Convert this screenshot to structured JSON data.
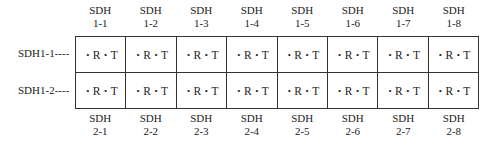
{
  "top_labels": [
    {
      "line1": "SDH",
      "line2": "1-1"
    },
    {
      "line1": "SDH",
      "line2": "1-2"
    },
    {
      "line1": "SDH",
      "line2": "1-3"
    },
    {
      "line1": "SDH",
      "line2": "1-4"
    },
    {
      "line1": "SDH",
      "line2": "1-5"
    },
    {
      "line1": "SDH",
      "line2": "1-6"
    },
    {
      "line1": "SDH",
      "line2": "1-7"
    },
    {
      "line1": "SDH",
      "line2": "1-8"
    }
  ],
  "bottom_labels": [
    {
      "line1": "SDH",
      "line2": "2-1"
    },
    {
      "line1": "SDH",
      "line2": "2-2"
    },
    {
      "line1": "SDH",
      "line2": "2-3"
    },
    {
      "line1": "SDH",
      "line2": "2-4"
    },
    {
      "line1": "SDH",
      "line2": "2-5"
    },
    {
      "line1": "SDH",
      "line2": "2-6"
    },
    {
      "line1": "SDH",
      "line2": "2-7"
    },
    {
      "line1": "SDH",
      "line2": "2-8"
    }
  ],
  "rows": [
    {
      "label": "SDH1-1----"
    },
    {
      "label": "SDH1-2----"
    }
  ],
  "cell": {
    "dot": "•",
    "receive": "R",
    "transmit": "T"
  }
}
